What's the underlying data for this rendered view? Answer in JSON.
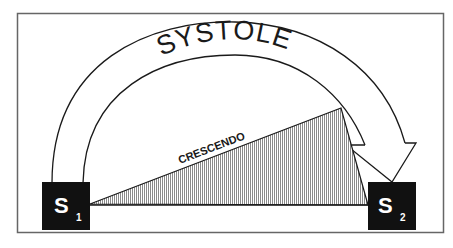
{
  "diagram": {
    "arc_label": "SYSTOLE",
    "murmur_label": "CRESCENDO",
    "s1": {
      "letter": "S",
      "subscript": "1"
    },
    "s2": {
      "letter": "S",
      "subscript": "2"
    },
    "colors": {
      "line": "#1a1a1a",
      "box": "#111111",
      "hatch": "#9a9a9a",
      "frame": "#666666"
    }
  }
}
